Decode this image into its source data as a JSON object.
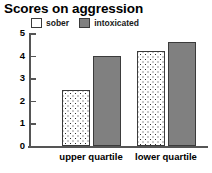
{
  "chart_data": {
    "type": "bar",
    "title": "Scores on aggression",
    "xlabel": "",
    "ylabel": "",
    "categories": [
      "upper quartile",
      "lower quartile"
    ],
    "series": [
      {
        "name": "sober",
        "values": [
          2.5,
          4.2
        ],
        "color": "#ffffff",
        "pattern": "dotted"
      },
      {
        "name": "intoxicated",
        "values": [
          4.0,
          4.6
        ],
        "color": "#808080",
        "pattern": "solid"
      }
    ],
    "ylim": [
      0,
      5
    ],
    "yticks": [
      0,
      1,
      2,
      3,
      4,
      5
    ],
    "ytick_labels": [
      "0",
      "1",
      "2",
      "3",
      "4",
      "5"
    ],
    "grid": false,
    "legend_position": "top-left"
  },
  "legend": {
    "entries": [
      {
        "label": "sober",
        "swatch": "dotted-swatch-icon"
      },
      {
        "label": "intoxicated",
        "swatch": "gray-swatch-icon"
      }
    ]
  },
  "axes": {
    "y_tick_labels": [
      "5",
      "4",
      "3",
      "2",
      "1",
      "0"
    ],
    "x_tick_labels": [
      "upper quartile",
      "lower quartile"
    ]
  }
}
